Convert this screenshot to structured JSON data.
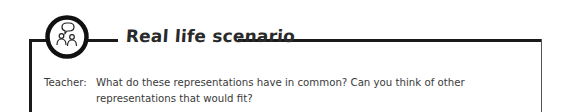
{
  "header": {
    "icon": "people-talking-icon",
    "title": "Real life scenario"
  },
  "dialogue": [
    {
      "speaker": "Teacher:",
      "text": "What do these representations have in common? Can you think of other representations that would fit?"
    }
  ],
  "colors": {
    "line": "#1a1a1a",
    "text": "#3a3a3a",
    "background": "#ffffff"
  }
}
